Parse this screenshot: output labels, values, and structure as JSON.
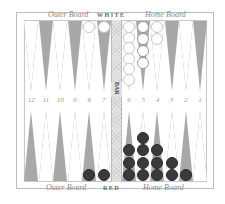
{
  "board": {
    "top": {
      "left_label": "Outer Board",
      "center_label": "WHITE",
      "right_label": "Home Board"
    },
    "bottom": {
      "left_label": "Outer Board",
      "center_label": "RED",
      "right_label": "Home Board"
    },
    "bar_label": "BAR",
    "point_numbers_left": [
      "12",
      "11",
      "10",
      "9",
      "8",
      "7"
    ],
    "point_numbers_right": [
      "6",
      "5",
      "4",
      "3",
      "2",
      "1"
    ],
    "colors": {
      "dark_point": "#a8a8a8",
      "light_point": "#ffffff",
      "white_checker": "#ffffff",
      "red_checker": "#3a3a3a",
      "bar": "#e6e6e6"
    }
  },
  "position": {
    "top_points": [
      {
        "point": 12,
        "white": 0
      },
      {
        "point": 11,
        "white": 0
      },
      {
        "point": 10,
        "white": 0
      },
      {
        "point": 9,
        "white": 0
      },
      {
        "point": 8,
        "white": 1
      },
      {
        "point": 7,
        "white": 1
      },
      {
        "point": 6,
        "white": 6
      },
      {
        "point": 5,
        "white": 4
      },
      {
        "point": 4,
        "white": 2
      },
      {
        "point": 3,
        "white": 0
      },
      {
        "point": 2,
        "white": 0
      },
      {
        "point": 1,
        "white": 0
      }
    ],
    "bottom_points": [
      {
        "index": 1,
        "red": 0
      },
      {
        "index": 2,
        "red": 0
      },
      {
        "index": 3,
        "red": 0
      },
      {
        "index": 4,
        "red": 0
      },
      {
        "index": 5,
        "red": 1
      },
      {
        "index": 6,
        "red": 1
      },
      {
        "index": 7,
        "red": 3
      },
      {
        "index": 8,
        "red": 4
      },
      {
        "index": 9,
        "red": 3
      },
      {
        "index": 10,
        "red": 2
      },
      {
        "index": 11,
        "red": 1
      },
      {
        "index": 12,
        "red": 0
      }
    ]
  }
}
